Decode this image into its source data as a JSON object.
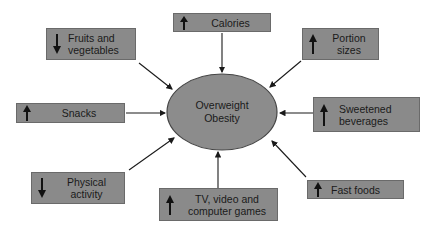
{
  "center": {
    "label": "Overweight\nObesity"
  },
  "factors": [
    {
      "id": "fruits",
      "label": "Fruits and\nvegetables",
      "direction": "down"
    },
    {
      "id": "calories",
      "label": "Calories",
      "direction": "up"
    },
    {
      "id": "portion",
      "label": "Portion\nsizes",
      "direction": "up"
    },
    {
      "id": "snacks",
      "label": "Snacks",
      "direction": "up"
    },
    {
      "id": "sweetened",
      "label": "Sweetened\nbeverages",
      "direction": "up"
    },
    {
      "id": "physical",
      "label": "Physical\nactivity",
      "direction": "down"
    },
    {
      "id": "tv",
      "label": "TV, video and\ncomputer games",
      "direction": "up"
    },
    {
      "id": "fastfoods",
      "label": "Fast foods",
      "direction": "up"
    }
  ],
  "colors": {
    "box_fill": "#8a8a8a",
    "ellipse_fill": "#8c8c8c",
    "line": "#1a1a1a"
  }
}
